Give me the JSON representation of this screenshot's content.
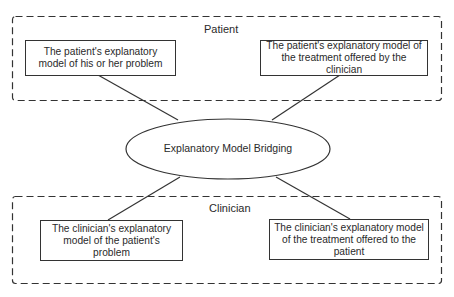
{
  "diagram": {
    "center": {
      "label": "Explanatory Model Bridging"
    },
    "groups": [
      {
        "label": "Patient",
        "nodes": [
          {
            "text": "The patient's explanatory model of his or her problem"
          },
          {
            "text": "The patient's explanatory model of the treatment offered by the clinician"
          }
        ]
      },
      {
        "label": "Clinician",
        "nodes": [
          {
            "text": "The clinician's explanatory model of the patient's problem"
          },
          {
            "text": "The clinician's explanatory model of the treatment offered to the patient"
          }
        ]
      }
    ],
    "colors": {
      "stroke": "#333333",
      "background": "#ffffff",
      "text": "#2a2a2a"
    }
  }
}
